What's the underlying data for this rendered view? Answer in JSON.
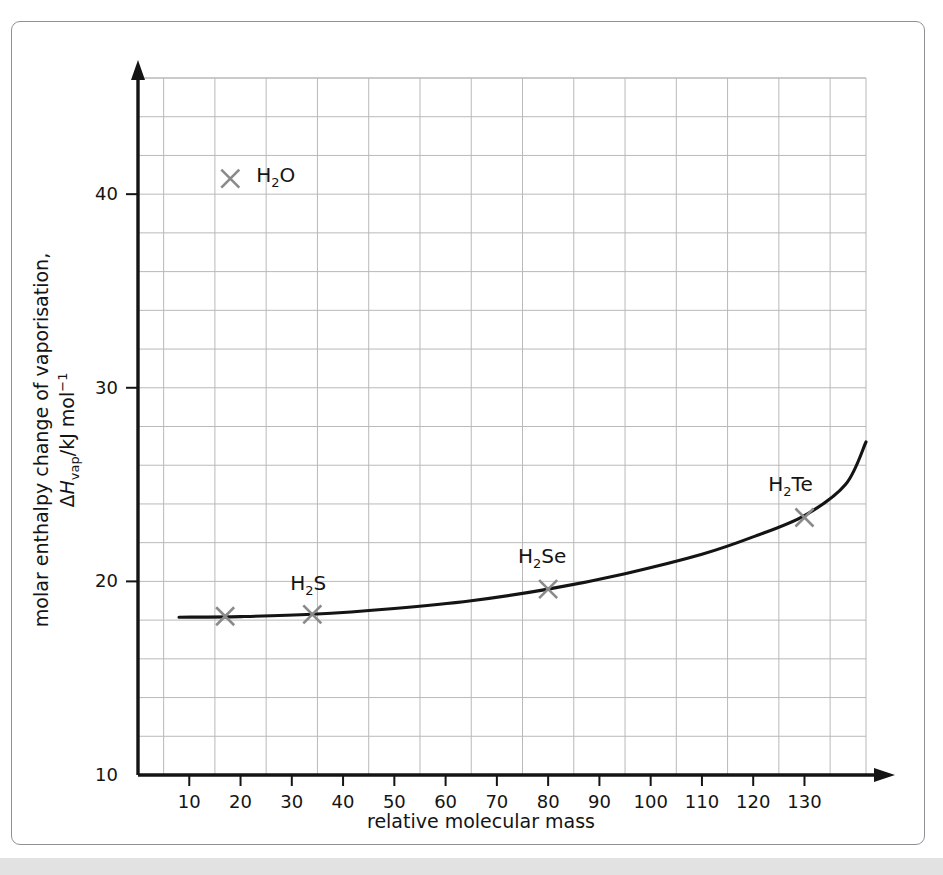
{
  "figure": {
    "frame_color": "#8e9295",
    "background": "#ffffff",
    "band_color": "#e2e2e2"
  },
  "chart_data": {
    "type": "scatter",
    "title": "",
    "xlabel": "relative molecular mass",
    "ylabel_line1": "molar enthalpy change of vaporisation,",
    "ylabel_line2_prefix": "Δ",
    "ylabel_line2_italic": "H",
    "ylabel_line2_sub": "vap",
    "ylabel_line2_mid": "/kJ mol",
    "ylabel_line2_sup": "−1",
    "xlim": [
      0,
      142
    ],
    "ylim": [
      10,
      46
    ],
    "xticks": [
      10,
      20,
      30,
      40,
      50,
      60,
      70,
      80,
      90,
      100,
      110,
      120,
      130
    ],
    "xtick_labels": [
      "10",
      "20",
      "30",
      "40",
      "50",
      "60",
      "70",
      "80",
      "90",
      "100",
      "110",
      "120",
      "130"
    ],
    "yticks": [
      20,
      30,
      40
    ],
    "ytick_labels": [
      "20",
      "30",
      "40"
    ],
    "ybottom_label": "10",
    "grid": true,
    "grid_color": "#b9b9b9",
    "grid_x_start": 5,
    "grid_x_step": 10,
    "grid_y_start": 12,
    "grid_y_step": 2,
    "legend": "none",
    "axis_color": "#141414",
    "curve_color": "#141414",
    "marker_color": "#8a8a8a",
    "marker_symbol": "×",
    "points": [
      {
        "label": "",
        "x": 17,
        "y": 18.2,
        "label_dx": 0,
        "label_dy": 0,
        "labelled": false
      },
      {
        "label": "H2O",
        "x": 18,
        "y": 40.8,
        "label_dx": 26,
        "label_dy": 3,
        "labelled": true
      },
      {
        "label": "H2S",
        "x": 34,
        "y": 18.3,
        "label_dx": -4,
        "label_dy": -24,
        "labelled": true
      },
      {
        "label": "H2Se",
        "x": 80,
        "y": 19.6,
        "label_dx": -6,
        "label_dy": -26,
        "labelled": true
      },
      {
        "label": "H2Te",
        "x": 130,
        "y": 23.3,
        "label_dx": -14,
        "label_dy": -26,
        "labelled": true
      }
    ],
    "curve": [
      {
        "x": 8,
        "y": 18.15
      },
      {
        "x": 20,
        "y": 18.18
      },
      {
        "x": 34,
        "y": 18.3
      },
      {
        "x": 50,
        "y": 18.6
      },
      {
        "x": 65,
        "y": 19.0
      },
      {
        "x": 80,
        "y": 19.6
      },
      {
        "x": 95,
        "y": 20.4
      },
      {
        "x": 110,
        "y": 21.4
      },
      {
        "x": 120,
        "y": 22.3
      },
      {
        "x": 130,
        "y": 23.4
      },
      {
        "x": 138,
        "y": 25.0
      },
      {
        "x": 142,
        "y": 27.2
      }
    ],
    "series_labels": [
      "H₂O",
      "H₂S",
      "H₂Se",
      "H₂Te"
    ]
  }
}
